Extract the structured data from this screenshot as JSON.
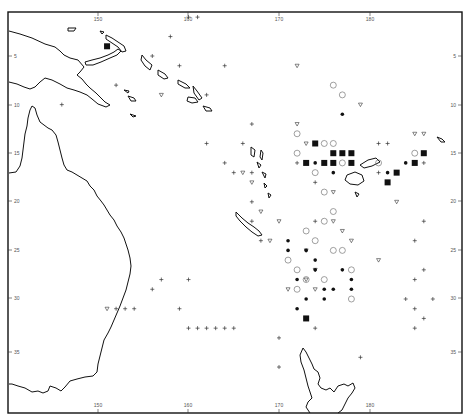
{
  "map": {
    "type": "scatter-map",
    "region": "Southwest Pacific (Australia, Papua New Guinea, Solomon Is., Vanuatu, New Caledonia, Fiji, New Zealand)",
    "frame": {
      "left": 8,
      "top": 12,
      "right": 462,
      "bottom": 413
    },
    "colors": {
      "ink": "#111111",
      "symbol": "#333333",
      "open": "#777777",
      "paper": "#ffffff"
    },
    "longitude_ticks": [
      {
        "label": "150",
        "x": 98
      },
      {
        "label": "160",
        "x": 188
      },
      {
        "label": "170",
        "x": 279
      },
      {
        "label": "180",
        "x": 370
      }
    ],
    "latitude_ticks": [
      {
        "label": "5",
        "y": 56
      },
      {
        "label": "10",
        "y": 105
      },
      {
        "label": "15",
        "y": 153
      },
      {
        "label": "20",
        "y": 201
      },
      {
        "label": "25",
        "y": 250
      },
      {
        "label": "30",
        "y": 298
      },
      {
        "label": "35",
        "y": 352
      }
    ],
    "legend_symbols": [
      "plus",
      "triangle-down-open",
      "circle-open",
      "dot-filled",
      "square-filled"
    ]
  },
  "chart_data": {
    "type": "scatter",
    "title": "",
    "xlabel": "Longitude (°E)",
    "ylabel": "Latitude (°S)",
    "xlim": [
      145,
      195
    ],
    "ylim": [
      0,
      40
    ],
    "x_ticks": [
      "150",
      "160",
      "170",
      "180"
    ],
    "y_ticks": [
      "5",
      "10",
      "15",
      "20",
      "25",
      "30",
      "35"
    ],
    "series": [
      {
        "name": "plus",
        "points": [
          [
            158,
            3
          ],
          [
            160,
            1
          ],
          [
            161,
            1
          ],
          [
            156,
            5
          ],
          [
            159,
            6
          ],
          [
            164,
            6
          ],
          [
            162,
            9
          ],
          [
            146,
            10
          ],
          [
            167,
            12
          ],
          [
            166,
            14
          ],
          [
            152,
            8
          ],
          [
            162,
            14
          ],
          [
            164,
            16
          ],
          [
            165,
            17
          ],
          [
            167,
            17
          ],
          [
            167,
            20
          ],
          [
            167,
            22
          ],
          [
            168,
            24
          ],
          [
            172,
            16
          ],
          [
            174,
            18
          ],
          [
            174,
            22
          ],
          [
            181,
            14
          ],
          [
            182,
            14
          ],
          [
            181,
            17
          ],
          [
            186,
            16
          ],
          [
            186,
            22
          ],
          [
            185,
            24
          ],
          [
            186,
            27
          ],
          [
            185,
            28
          ],
          [
            187,
            30
          ],
          [
            184,
            30
          ],
          [
            185,
            31
          ],
          [
            186,
            32
          ],
          [
            185,
            33
          ],
          [
            174,
            33
          ],
          [
            170,
            34
          ],
          [
            170,
            37
          ],
          [
            179,
            36
          ],
          [
            156,
            29
          ],
          [
            159,
            31
          ],
          [
            152,
            31
          ],
          [
            153,
            31
          ],
          [
            154,
            31
          ],
          [
            160,
            33
          ],
          [
            161,
            33
          ],
          [
            163,
            33
          ],
          [
            164,
            33
          ],
          [
            165,
            33
          ],
          [
            157,
            28
          ],
          [
            160,
            28
          ],
          [
            162,
            33
          ]
        ]
      },
      {
        "name": "triangle-down-open",
        "points": [
          [
            157,
            9
          ],
          [
            172,
            6
          ],
          [
            172,
            12
          ],
          [
            179,
            10
          ],
          [
            173,
            14
          ],
          [
            176,
            19
          ],
          [
            176,
            22
          ],
          [
            177,
            23
          ],
          [
            178,
            24
          ],
          [
            173,
            25
          ],
          [
            174,
            27
          ],
          [
            173,
            28
          ],
          [
            171,
            29
          ],
          [
            174,
            29
          ],
          [
            183,
            20
          ],
          [
            185,
            13
          ],
          [
            186,
            13
          ],
          [
            166,
            17
          ],
          [
            167,
            18
          ],
          [
            168,
            21
          ],
          [
            169,
            24
          ],
          [
            170,
            22
          ],
          [
            151,
            31
          ],
          [
            181,
            26
          ]
        ]
      },
      {
        "name": "circle-open",
        "points": [
          [
            176,
            8
          ],
          [
            177,
            9
          ],
          [
            172,
            13
          ],
          [
            172,
            15
          ],
          [
            174,
            17
          ],
          [
            177,
            16
          ],
          [
            175,
            19
          ],
          [
            176,
            21
          ],
          [
            176,
            25
          ],
          [
            177,
            25
          ],
          [
            178,
            27
          ],
          [
            171,
            26
          ],
          [
            172,
            27
          ],
          [
            172,
            29
          ],
          [
            173,
            28
          ],
          [
            175,
            28
          ],
          [
            178,
            30
          ],
          [
            181,
            16
          ],
          [
            185,
            15
          ],
          [
            175,
            14
          ],
          [
            176,
            14
          ],
          [
            173,
            23
          ],
          [
            174,
            24
          ],
          [
            175,
            22
          ]
        ]
      },
      {
        "name": "dot-filled",
        "points": [
          [
            177,
            11
          ],
          [
            174,
            16
          ],
          [
            175,
            16
          ],
          [
            176,
            16
          ],
          [
            176,
            17
          ],
          [
            171,
            24
          ],
          [
            171,
            25
          ],
          [
            173,
            25
          ],
          [
            174,
            26
          ],
          [
            174,
            27
          ],
          [
            172,
            28
          ],
          [
            175,
            29
          ],
          [
            175,
            30
          ],
          [
            176,
            29
          ],
          [
            177,
            27
          ],
          [
            178,
            28
          ],
          [
            178,
            29
          ],
          [
            173,
            30
          ],
          [
            173,
            32
          ],
          [
            184,
            16
          ],
          [
            182,
            17
          ],
          [
            172,
            31
          ]
        ]
      },
      {
        "name": "square-filled",
        "points": [
          [
            151,
            4
          ],
          [
            174,
            14
          ],
          [
            173,
            16
          ],
          [
            175,
            16
          ],
          [
            176,
            15
          ],
          [
            176,
            16
          ],
          [
            177,
            15
          ],
          [
            178,
            16
          ],
          [
            178,
            15
          ],
          [
            183,
            17
          ],
          [
            185,
            16
          ],
          [
            186,
            15
          ],
          [
            182,
            18
          ],
          [
            173,
            32
          ]
        ]
      }
    ]
  }
}
